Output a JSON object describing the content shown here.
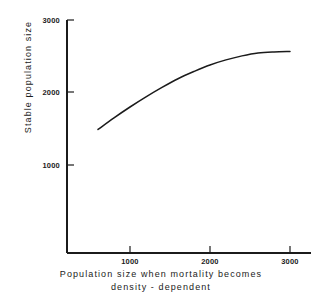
{
  "chart_data": {
    "type": "line",
    "title": "",
    "xlabel": "Population size when mortality becomes density - dependent",
    "ylabel": "Stable population size",
    "xlim": [
      0,
      3250
    ],
    "ylim": [
      0,
      3000
    ],
    "grid": false,
    "legend": null,
    "xticks": [
      1000,
      2000,
      3000
    ],
    "xticklabels": [
      "1000",
      "2000",
      "3000"
    ],
    "yticks": [
      1000,
      2000,
      3000
    ],
    "yticklabels": [
      "1000",
      "2000",
      "3000"
    ],
    "series": [
      {
        "name": "stable population size",
        "x": [
          600,
          800,
          1000,
          1200,
          1400,
          1600,
          1800,
          2000,
          2200,
          2400,
          2600,
          2800,
          3000
        ],
        "y": [
          1490,
          1650,
          1800,
          1940,
          2070,
          2190,
          2290,
          2380,
          2450,
          2505,
          2545,
          2560,
          2565
        ]
      }
    ]
  },
  "axis_titles": {
    "y": "Stable population size",
    "x_line1": "Population size when mortality becomes",
    "x_line2": "density - dependent"
  },
  "ticks": {
    "y": [
      {
        "label": "3000",
        "value": 3000
      },
      {
        "label": "2000",
        "value": 2000
      },
      {
        "label": "1000",
        "value": 1000
      }
    ],
    "x": [
      {
        "label": "1000",
        "value": 1000
      },
      {
        "label": "2000",
        "value": 2000
      },
      {
        "label": "3000",
        "value": 3000
      }
    ]
  },
  "colors": {
    "ink": "#1b1b1b",
    "background": "#ffffff",
    "curve": "#1b1b1b"
  }
}
